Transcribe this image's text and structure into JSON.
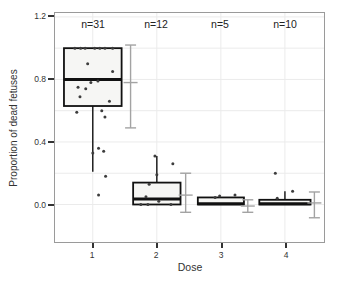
{
  "figure": {
    "xlabel": "Dose",
    "ylabel": "Proportion of dead fetuses",
    "y_tick_labels": [
      "1.2",
      "0.8",
      "0.4",
      "0.0"
    ],
    "x_tick_labels": [
      "1",
      "2",
      "3",
      "4"
    ],
    "n_labels": [
      "n=31",
      "n=12",
      "n=5",
      "n=10"
    ]
  },
  "chart_data": {
    "type": "boxplot",
    "title": "",
    "xlabel": "Dose",
    "ylabel": "Proportion of dead fetuses",
    "x_categories": [
      1,
      2,
      3,
      4
    ],
    "sample_sizes": [
      31,
      12,
      5,
      10
    ],
    "xlim": [
      0.41,
      4.61
    ],
    "ylim": [
      -0.24,
      1.225
    ],
    "y_ticks": [
      0.0,
      0.4,
      0.8,
      1.2
    ],
    "grid_y": [
      0.0,
      0.2,
      0.4,
      0.6,
      0.8,
      1.0,
      1.2
    ],
    "grid": true,
    "legend": "none",
    "colors": {
      "background": "#ffffff",
      "grid": "#ebebeb",
      "box_fill": "#f6f6f4",
      "box_stroke": "#111111",
      "median": "#111111",
      "point": "#3d3d3d",
      "ci_bar": "#a3a3a3",
      "axis_border": "#9a9a9a",
      "tick": "#333333"
    },
    "groups": [
      {
        "dose": 1,
        "n": 31,
        "n_label": "n=31",
        "half_width": 0.45,
        "q1": 0.63,
        "median": 0.8,
        "q3": 1.0,
        "whisker_low": 0.21,
        "whisker_high": 1.0,
        "ci": {
          "x_offset": 0.59,
          "low": 0.49,
          "mid": 0.78,
          "high": 1.02
        },
        "points": [
          [
            -0.28,
            1.0
          ],
          [
            -0.19,
            1.0
          ],
          [
            -0.12,
            1.0
          ],
          [
            0.03,
            1.0
          ],
          [
            0.11,
            1.0
          ],
          [
            0.19,
            1.0
          ],
          [
            0.31,
            1.0
          ],
          [
            -0.08,
            0.9
          ],
          [
            0.31,
            0.85
          ],
          [
            0.08,
            0.79
          ],
          [
            -0.03,
            0.78
          ],
          [
            -0.23,
            0.75
          ],
          [
            -0.11,
            0.74
          ],
          [
            -0.2,
            0.69
          ],
          [
            0.26,
            0.66
          ],
          [
            0.14,
            0.6
          ],
          [
            -0.25,
            0.59
          ],
          [
            0.19,
            0.56
          ],
          [
            0.09,
            0.36
          ],
          [
            0.17,
            0.34
          ],
          [
            0.0,
            0.33
          ],
          [
            0.2,
            0.18
          ],
          [
            0.09,
            0.06
          ]
        ]
      },
      {
        "dose": 2,
        "n": 12,
        "n_label": "n=12",
        "half_width": 0.37,
        "q1": 0.0,
        "median": 0.035,
        "q3": 0.14,
        "whisker_low": 0.0,
        "whisker_high": 0.31,
        "ci": {
          "x_offset": 0.45,
          "low": -0.05,
          "mid": 0.06,
          "high": 0.2
        },
        "points": [
          [
            -0.03,
            0.31
          ],
          [
            0.25,
            0.26
          ],
          [
            0.0,
            0.19
          ],
          [
            -0.12,
            0.13
          ],
          [
            -0.17,
            0.05
          ],
          [
            0.03,
            0.02
          ],
          [
            -0.25,
            0.0
          ],
          [
            -0.14,
            0.0
          ],
          [
            0.22,
            0.0
          ]
        ]
      },
      {
        "dose": 3,
        "n": 5,
        "n_label": "n=5",
        "half_width": 0.36,
        "q1": 0.0,
        "median": 0.005,
        "q3": 0.045,
        "whisker_low": 0.0,
        "whisker_high": 0.045,
        "ci": {
          "x_offset": 0.42,
          "low": -0.05,
          "mid": -0.01,
          "high": 0.03
        },
        "points": [
          [
            -0.09,
            0.045
          ],
          [
            -0.02,
            0.055
          ],
          [
            0.22,
            0.06
          ]
        ]
      },
      {
        "dose": 4,
        "n": 10,
        "n_label": "n=10",
        "half_width": 0.4,
        "q1": 0.0,
        "median": 0.005,
        "q3": 0.03,
        "whisker_low": 0.0,
        "whisker_high": 0.085,
        "ci": {
          "x_offset": 0.46,
          "low": -0.085,
          "mid": 0.01,
          "high": 0.08
        },
        "points": [
          [
            -0.15,
            0.2
          ],
          [
            0.12,
            0.085
          ],
          [
            -0.12,
            0.04
          ]
        ]
      }
    ]
  }
}
